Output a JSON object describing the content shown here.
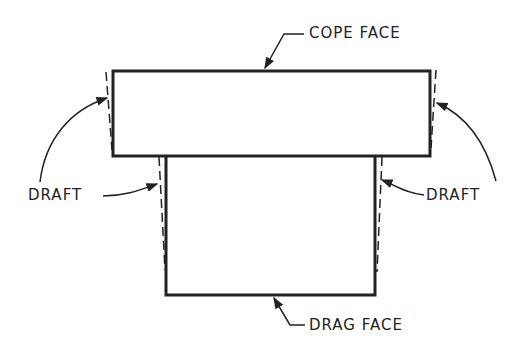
{
  "diagram": {
    "labels": {
      "cope_face": "COPE FACE",
      "drag_face": "DRAG FACE",
      "draft_left": "DRAFT",
      "draft_right": "DRAFT"
    },
    "colors": {
      "stroke": "#222222",
      "background": "#ffffff"
    }
  }
}
